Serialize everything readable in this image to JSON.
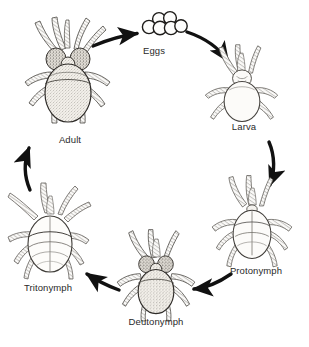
{
  "diagram": {
    "type": "cycle-diagram",
    "background_color": "#ffffff",
    "ink_color": "#1a1a1a",
    "label_color": "#2a2a2a",
    "stage_count": 6,
    "arrow_count": 6,
    "direction": "clockwise",
    "stages": [
      {
        "id": "eggs",
        "label": "Eggs",
        "label_x": 154,
        "label_y": 52,
        "art_cx": 162,
        "art_cy": 25,
        "art": "egg-cluster",
        "egg_count": 6,
        "shaded": false
      },
      {
        "id": "larva",
        "label": "Larva",
        "label_x": 243,
        "label_y": 127,
        "art_cx": 242,
        "art_cy": 92,
        "art": "mite-larva",
        "leg_pairs": 3,
        "shaded": false
      },
      {
        "id": "protonymph",
        "label": "Protonymph",
        "label_x": 255,
        "label_y": 272,
        "art_cx": 252,
        "art_cy": 230,
        "art": "mite-protonymph",
        "leg_pairs": 4,
        "shaded": false
      },
      {
        "id": "deutonymph",
        "label": "Deutonymph",
        "label_x": 155,
        "label_y": 323,
        "art_cx": 156,
        "art_cy": 282,
        "art": "mite-deutonymph",
        "leg_pairs": 4,
        "shaded": true
      },
      {
        "id": "tritonymph",
        "label": "Tritonymph",
        "label_x": 48,
        "label_y": 289,
        "art_cx": 48,
        "art_cy": 240,
        "art": "mite-tritonymph",
        "leg_pairs": 4,
        "shaded": false
      },
      {
        "id": "adult",
        "label": "Adult",
        "label_x": 70,
        "label_y": 141,
        "art_cx": 68,
        "art_cy": 80,
        "art": "mite-adult",
        "leg_pairs": 4,
        "shaded": true
      }
    ],
    "arrows": [
      {
        "id": "adult-to-eggs",
        "from": "adult",
        "to": "eggs",
        "points": "93,46 120,37 138,34"
      },
      {
        "id": "eggs-to-larva",
        "from": "eggs",
        "to": "larva",
        "points": "187,33 213,44 228,60"
      },
      {
        "id": "larva-to-protonymph",
        "from": "larva",
        "to": "protonymph",
        "points": "270,143 275,165 271,186"
      },
      {
        "id": "protonymph-to-deutonymph",
        "from": "protonymph",
        "to": "deutonymph",
        "points": "230,275 212,285 192,288"
      },
      {
        "id": "deutonymph-to-tritonymph",
        "from": "deutonymph",
        "to": "tritonymph",
        "points": "118,289 102,283 86,274"
      },
      {
        "id": "tritonymph-to-adult",
        "from": "tritonymph",
        "to": "adult",
        "points": "30,189 25,168 29,147"
      }
    ]
  }
}
